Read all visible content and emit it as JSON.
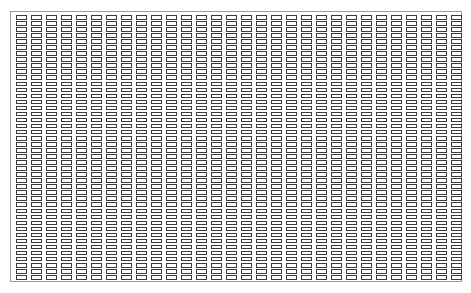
{
  "figure": {
    "type": "cell-array-grid",
    "columns": 30,
    "rows": 44,
    "cell_border_color": "#3a3a3a",
    "frame_border_color": "#9a9a9a",
    "background_color": "#ffffff",
    "caption": ""
  }
}
